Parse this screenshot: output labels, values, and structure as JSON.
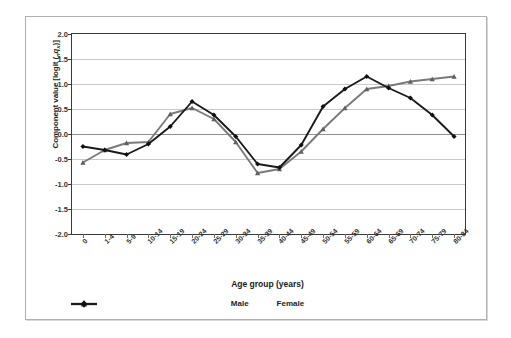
{
  "chart_data": {
    "type": "line",
    "title": "",
    "xlabel": "Age group (years)",
    "ylabel": "Component value [logit (nqx)]",
    "ylim": [
      -2.0,
      2.0
    ],
    "yticks": [
      2.0,
      1.5,
      1.0,
      0.5,
      0.0,
      -0.5,
      -1.0,
      -1.5,
      -2.0
    ],
    "ytick_labels": [
      "2.0",
      "1.5",
      "1.0",
      "0.5",
      "0.0",
      "-0.5",
      "-1.0",
      "-1.5",
      "-2.0"
    ],
    "grid": true,
    "legend_position": "bottom",
    "categories": [
      "0",
      "1-4",
      "5-9",
      "10-14",
      "15-19",
      "20-24",
      "25-29",
      "30-34",
      "35-39",
      "40-44",
      "45-49",
      "50-54",
      "55-59",
      "60-64",
      "65-69",
      "70-74",
      "75-79",
      "80-84"
    ],
    "series": [
      {
        "name": "Male",
        "color": "#7a7a7a",
        "marker": "triangle",
        "values": [
          -0.57,
          -0.32,
          -0.18,
          -0.16,
          0.4,
          0.52,
          0.3,
          -0.16,
          -0.78,
          -0.7,
          -0.35,
          0.1,
          0.52,
          0.9,
          0.96,
          1.05,
          1.1,
          1.15
        ]
      },
      {
        "name": "Female",
        "color": "#1a1a1a",
        "marker": "diamond",
        "values": [
          -0.25,
          -0.32,
          -0.41,
          -0.2,
          0.15,
          0.65,
          0.38,
          -0.05,
          -0.6,
          -0.67,
          -0.22,
          0.55,
          0.9,
          1.15,
          0.92,
          0.72,
          0.38,
          -0.05
        ]
      }
    ]
  },
  "legend": {
    "male_label": "Male",
    "female_label": "Female"
  },
  "axis": {
    "x_title": "Age group (years)",
    "y_title_prefix": "Component value [logit (",
    "y_title_sub": "n",
    "y_title_q": "q",
    "y_title_sub2": "x",
    "y_title_suffix": ")]"
  }
}
